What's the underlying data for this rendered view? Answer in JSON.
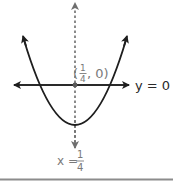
{
  "diagram": {
    "type": "parabola-with-axis-of-symmetry",
    "colors": {
      "curve": "#1e1e1e",
      "horizontal_line": "#2a2a2a",
      "symmetry_line": "#6e6e6e",
      "label_gray": "#7a7a7a",
      "label_dark": "#2a2a2a",
      "bottom_rule": "#8c8c8c"
    },
    "point_label": {
      "open": "(",
      "num": "1",
      "den": "4",
      "rest": ", 0)"
    },
    "horizontal_line_label": "y = 0",
    "symmetry_label": {
      "lhs": "x =",
      "num": "1",
      "den": "4"
    }
  }
}
